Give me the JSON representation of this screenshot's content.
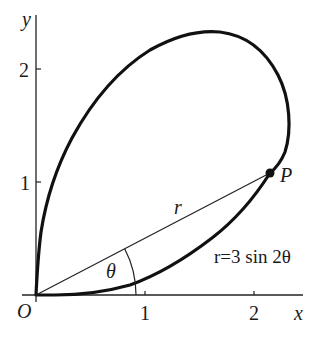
{
  "figure": {
    "colors": {
      "ink": "#111111",
      "background": "#ffffff"
    }
  },
  "axes": {
    "x_label": "x",
    "y_label": "y",
    "origin_label": "O",
    "x_ticks": [
      "1",
      "2"
    ],
    "y_ticks": [
      "1",
      "2"
    ]
  },
  "annotations": {
    "point_label": "P",
    "radius_label": "r",
    "angle_label": "θ",
    "equation": "r=3 sin 2θ"
  },
  "curve": {
    "equation": "r = 3 sin 2θ",
    "range": "0 ≤ θ ≤ π/2"
  }
}
